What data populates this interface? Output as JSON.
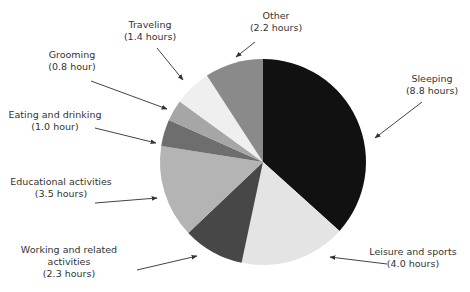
{
  "chart_data": {
    "type": "pie",
    "title": "",
    "unit": "hours",
    "total": 24.0,
    "start_angle_deg": 0,
    "direction": "clockwise",
    "categories": [
      "Sleeping",
      "Leisure and sports",
      "Working and related activities",
      "Educational activities",
      "Eating and drinking",
      "Grooming",
      "Traveling",
      "Other"
    ],
    "values": [
      8.8,
      4.0,
      2.3,
      3.5,
      1.0,
      0.8,
      1.4,
      2.2
    ],
    "slices": [
      {
        "label": "Sleeping",
        "value": 8.8,
        "value_text": "(8.8 hours)",
        "color": "#111111"
      },
      {
        "label": "Leisure and sports",
        "value": 4.0,
        "value_text": "(4.0 hours)",
        "color": "#e4e4e4"
      },
      {
        "label": "Working and related activities",
        "value": 2.3,
        "value_text": "(2.3 hours)",
        "color": "#474747"
      },
      {
        "label": "Educational activities",
        "value": 3.5,
        "value_text": "(3.5 hours)",
        "color": "#b4b4b4"
      },
      {
        "label": "Eating and drinking",
        "value": 1.0,
        "value_text": "(1.0 hour)",
        "color": "#6e6e6e"
      },
      {
        "label": "Grooming",
        "value": 0.8,
        "value_text": "(0.8 hour)",
        "color": "#a6a6a6"
      },
      {
        "label": "Traveling",
        "value": 1.4,
        "value_text": "(1.4 hours)",
        "color": "#efefef"
      },
      {
        "label": "Other",
        "value": 2.2,
        "value_text": "(2.2 hours)",
        "color": "#8a8a8a"
      }
    ],
    "legend": "none (callout labels with arrows)"
  },
  "labels": {
    "sleeping": {
      "line1": "Sleeping",
      "line2": "(8.8 hours)"
    },
    "leisure": {
      "line1": "Leisure and sports",
      "line2": "(4.0 hours)"
    },
    "working": {
      "line1": "Working and related",
      "line2": "activities",
      "line3": "(2.3 hours)"
    },
    "educational": {
      "line1": "Educational activities",
      "line2": "(3.5 hours)"
    },
    "eating": {
      "line1": "Eating and drinking",
      "line2": "(1.0 hour)"
    },
    "grooming": {
      "line1": "Grooming",
      "line2": "(0.8 hour)"
    },
    "traveling": {
      "line1": "Traveling",
      "line2": "(1.4 hours)"
    },
    "other": {
      "line1": "Other",
      "line2": "(2.2 hours)"
    }
  }
}
